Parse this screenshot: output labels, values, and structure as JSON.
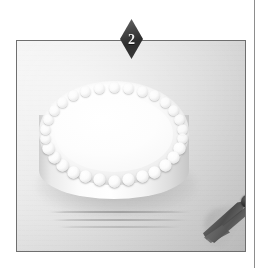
{
  "figure": {
    "step_badge": {
      "number": "2",
      "shape": "diamond",
      "fill_color": "#2d2d2d",
      "text_color": "#f2f2f2"
    },
    "photo": {
      "caption": "",
      "border_color": "#6f6f6f",
      "background_color": "#dcdcdc",
      "subjects": [
        {
          "name": "frosted-round-cake",
          "label": "Round cake with white buttercream frosting",
          "color": "#ffffff",
          "detail": "Scalloped shell piping border around the top edge"
        },
        {
          "name": "piping-tip",
          "label": "Metal star piping tip",
          "color": "#4a4a4a"
        }
      ]
    },
    "page": {
      "background_color": "#ffffff",
      "rule_color": "#8d8d8d"
    }
  }
}
